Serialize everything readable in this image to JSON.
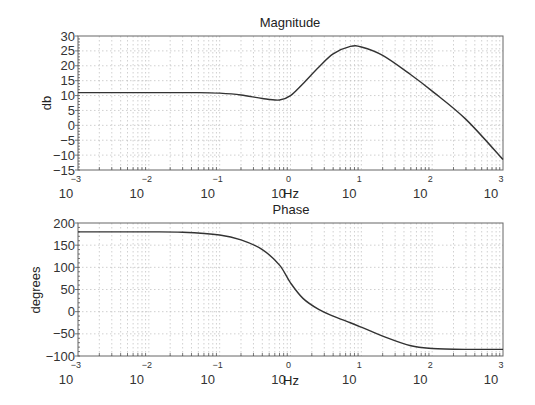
{
  "chart_data": [
    {
      "type": "line",
      "title": "Magnitude",
      "xlabel": "Hz",
      "ylabel": "db",
      "xscale": "log",
      "xlim": [
        0.001,
        1000
      ],
      "ylim": [
        -15,
        30
      ],
      "grid": true,
      "x_ticks": [
        "10^-3",
        "10^-2",
        "10^-1",
        "10^0",
        "10^1",
        "10^2",
        "10^3"
      ],
      "y_ticks": [
        30,
        25,
        20,
        15,
        10,
        5,
        0,
        -5,
        -10,
        -15
      ],
      "x": [
        0.001,
        0.01,
        0.05,
        0.1,
        0.2,
        0.4,
        0.7,
        1.0,
        1.5,
        2.5,
        4,
        7,
        10,
        20,
        50,
        100,
        300,
        1000
      ],
      "values": [
        11,
        11,
        11,
        10.8,
        10.2,
        9,
        8.5,
        10,
        14,
        19.5,
        24,
        26.5,
        26.3,
        23.5,
        17,
        11.5,
        2,
        -11.5
      ]
    },
    {
      "type": "line",
      "title": "Phase",
      "xlabel": "Hz",
      "ylabel": "degrees",
      "xscale": "log",
      "xlim": [
        0.001,
        1000
      ],
      "ylim": [
        -100,
        200
      ],
      "grid": true,
      "x_ticks": [
        "10^-3",
        "10^-2",
        "10^-1",
        "10^0",
        "10^1",
        "10^2",
        "10^3"
      ],
      "y_ticks": [
        200,
        150,
        100,
        50,
        0,
        -50,
        -100
      ],
      "x": [
        0.001,
        0.01,
        0.03,
        0.1,
        0.2,
        0.4,
        0.7,
        1.0,
        1.5,
        2.5,
        4,
        7,
        10,
        20,
        50,
        100,
        300,
        1000
      ],
      "values": [
        180,
        180,
        179,
        173,
        162,
        140,
        105,
        65,
        30,
        5,
        -10,
        -25,
        -35,
        -55,
        -77,
        -83,
        -85,
        -85
      ]
    }
  ],
  "magnitude": {
    "title": "Magnitude",
    "ylabel": "db",
    "xlabel": "Hz",
    "yticks": [
      "30",
      "25",
      "20",
      "15",
      "10",
      "5",
      "0",
      "-5",
      "-10",
      "-15"
    ],
    "xticks": [
      {
        "base": "10",
        "exp": "-3"
      },
      {
        "base": "10",
        "exp": "-2"
      },
      {
        "base": "10",
        "exp": "-1"
      },
      {
        "base": "10",
        "exp": "0"
      },
      {
        "base": "10",
        "exp": "1"
      },
      {
        "base": "10",
        "exp": "2"
      },
      {
        "base": "10",
        "exp": "3"
      }
    ]
  },
  "phase": {
    "title": "Phase",
    "ylabel": "degrees",
    "xlabel": "Hz",
    "yticks": [
      "200",
      "150",
      "100",
      "50",
      "0",
      "-50",
      "-100"
    ],
    "xticks": [
      {
        "base": "10",
        "exp": "-3"
      },
      {
        "base": "10",
        "exp": "-2"
      },
      {
        "base": "10",
        "exp": "-1"
      },
      {
        "base": "10",
        "exp": "0"
      },
      {
        "base": "10",
        "exp": "1"
      },
      {
        "base": "10",
        "exp": "2"
      },
      {
        "base": "10",
        "exp": "3"
      }
    ]
  }
}
